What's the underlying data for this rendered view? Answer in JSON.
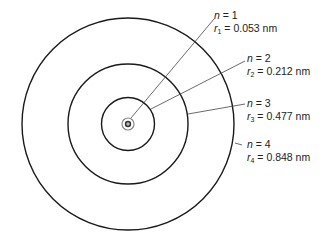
{
  "diagram": {
    "nucleus": {
      "symbol": "+"
    },
    "orbits": [
      {
        "n_label": "n",
        "n_value": "= 1",
        "r_label": "r",
        "r_sub": "1",
        "r_value": "= 0.053 nm",
        "radius_px": 7
      },
      {
        "n_label": "n",
        "n_value": "= 2",
        "r_label": "r",
        "r_sub": "2",
        "r_value": "= 0.212 nm",
        "radius_px": 27
      },
      {
        "n_label": "n",
        "n_value": "= 3",
        "r_label": "r",
        "r_sub": "3",
        "r_value": "= 0.477 nm",
        "radius_px": 60
      },
      {
        "n_label": "n",
        "n_value": "= 4",
        "r_label": "r",
        "r_sub": "4",
        "r_value": "= 0.848 nm",
        "radius_px": 106
      }
    ],
    "colors": {
      "line": "#1a1a1a",
      "leader": "#444444",
      "nucleus_ring": "#888888"
    }
  }
}
